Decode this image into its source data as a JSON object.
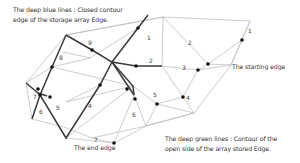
{
  "annotations": {
    "blue_lines_line1": "The deep blue lines : Closed contour",
    "blue_lines_line2": "edge of the storage array Edge.",
    "starting_edge": "The starting edge",
    "end_edge": "The end edge",
    "green_lines_line1": "The deep green lines : Contour of the",
    "green_lines_line2": "open side of the array stored Edge."
  },
  "colors": {
    "thin_edge": "#b5b5b5",
    "thick_edge": "#3a3a3a",
    "node": "#111111",
    "text": "#333333"
  },
  "edge_labels": [
    "1",
    "2",
    "3",
    "4",
    "5",
    "6",
    "7",
    "8",
    "9",
    "1",
    "2",
    "3",
    "4",
    "5",
    "6",
    "7"
  ],
  "labels": {
    "n1": "1",
    "n2": "2",
    "n3": "3",
    "n4": "4",
    "n5": "5",
    "n6": "6",
    "n7": "7",
    "n8": "8",
    "n9": "9",
    "r1": "1",
    "r2": "2",
    "r3": "3",
    "r4": "4",
    "r5": "5",
    "r6": "6",
    "r7": "7"
  }
}
